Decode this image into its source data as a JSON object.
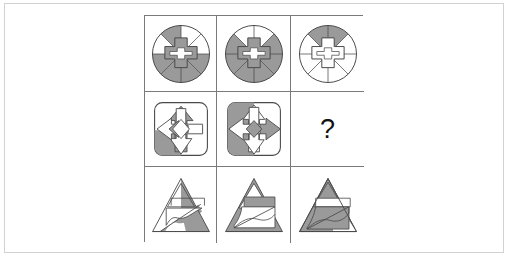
{
  "puzzle": {
    "type": "visual-analogy-matrix",
    "rows": 3,
    "cols": 3,
    "missing_cell": "row2-col3",
    "missing_marker": "?",
    "colors": {
      "shade": "#9a9a9a",
      "shade_dark": "#8f8f8f",
      "stroke": "#4a4a4a",
      "grid_line": "#7a7a7a",
      "page_frame": "#d2d2d2",
      "background": "#ffffff"
    },
    "cells": [
      {
        "id": "row1-col1",
        "row": 1,
        "col": 1,
        "figure": "circle-eight-sectors-with-center-cross",
        "description": "Circle split into eight sectors, alternating gray sectors, plus a gray cross at the center",
        "shaded_sectors": [
          1,
          3,
          4,
          6
        ],
        "center_shape": "cross"
      },
      {
        "id": "row1-col2",
        "row": 1,
        "col": 2,
        "figure": "circle-eight-sectors-with-center-cross",
        "description": "Circle split into eight sectors, gray sectors rotated one step, plus a gray cross at the center",
        "shaded_sectors": [
          2,
          3,
          5,
          7
        ],
        "center_shape": "cross"
      },
      {
        "id": "row1-col3",
        "row": 1,
        "col": 3,
        "figure": "circle-eight-sectors-with-center-cross",
        "description": "Circle split into eight sectors, only the top wedge gray, plus a white cross at the center",
        "shaded_sectors": [
          0
        ],
        "center_shape": "cross"
      },
      {
        "id": "row2-col1",
        "row": 2,
        "col": 1,
        "figure": "rounded-square-four-arrows",
        "description": "Rounded square containing up, down, left and right arrows; lower-left quadrant and up arrow shaded gray",
        "shaded_regions": [
          "up-arrow",
          "lower-left-quadrant"
        ]
      },
      {
        "id": "row2-col2",
        "row": 2,
        "col": 2,
        "figure": "rounded-square-four-arrows",
        "description": "Rounded square containing up, down, left and right arrows; whole left band and right arrow shaded gray",
        "shaded_regions": [
          "left-band",
          "right-arrow",
          "lower-left-quadrant"
        ]
      },
      {
        "id": "row2-col3",
        "row": 2,
        "col": 3,
        "figure": "question-mark",
        "description": "Missing element, marked with a question mark"
      },
      {
        "id": "row3-col1",
        "row": 3,
        "col": 1,
        "figure": "triangle-with-inner-bands",
        "description": "Large triangle with a small inner triangle, a horizontal band and a wavy diagonal band; right flank and lower wave shaded gray",
        "shaded_regions": [
          "right-flank",
          "lower-wave-band"
        ]
      },
      {
        "id": "row3-col2",
        "row": 3,
        "col": 2,
        "figure": "triangle-with-inner-bands",
        "description": "Large triangle with a small inner triangle, a horizontal band and a wavy diagonal band; outer triangle and upper band shaded gray",
        "shaded_regions": [
          "outer-triangle",
          "upper-band"
        ]
      },
      {
        "id": "row3-col3",
        "row": 3,
        "col": 3,
        "figure": "triangle-with-inner-bands",
        "description": "Large triangle with a small inner triangle, a horizontal band and a wavy diagonal band; apex and lower wave band shaded gray",
        "shaded_regions": [
          "apex",
          "lower-wave-band",
          "left-flank"
        ]
      }
    ]
  }
}
